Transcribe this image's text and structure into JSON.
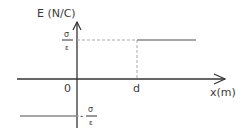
{
  "diagram": {
    "y_axis_label": "E (N/C)",
    "x_axis_label": "x(m)",
    "origin_label": "0",
    "d_label": "d",
    "upper_level": {
      "numerator": "σ",
      "denominator": "ε"
    },
    "lower_level": {
      "sign": "-",
      "numerator": "σ",
      "denominator": "ε"
    },
    "colors": {
      "axis": "#333333",
      "level": "#888888",
      "dash": "#aaaaaa"
    }
  }
}
